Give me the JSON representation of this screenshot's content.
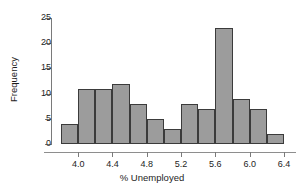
{
  "chart_data": {
    "type": "bar",
    "subtype": "histogram",
    "title": "",
    "xlabel": "% Unemployed",
    "ylabel": "Frequency",
    "xlim": [
      3.8,
      6.4
    ],
    "ylim": [
      0,
      25
    ],
    "bin_width": 0.2,
    "grid": false,
    "legend": null,
    "bar_color": "#9c9c9c",
    "bar_edge_color": "#3b3b3b",
    "x_ticks": [
      "4.0",
      "4.4",
      "4.8",
      "5.2",
      "5.6",
      "6.0",
      "6.4"
    ],
    "x_tick_values": [
      4.0,
      4.4,
      4.8,
      5.2,
      5.6,
      6.0,
      6.4
    ],
    "y_ticks": [
      "0",
      "5",
      "10",
      "15",
      "20",
      "25"
    ],
    "y_tick_values": [
      0,
      5,
      10,
      15,
      20,
      25
    ],
    "bins": [
      {
        "left": 3.8,
        "right": 4.0,
        "frequency": 4
      },
      {
        "left": 4.0,
        "right": 4.2,
        "frequency": 11
      },
      {
        "left": 4.2,
        "right": 4.4,
        "frequency": 11
      },
      {
        "left": 4.4,
        "right": 4.6,
        "frequency": 12
      },
      {
        "left": 4.6,
        "right": 4.8,
        "frequency": 8
      },
      {
        "left": 4.8,
        "right": 5.0,
        "frequency": 5
      },
      {
        "left": 5.0,
        "right": 5.2,
        "frequency": 3
      },
      {
        "left": 5.2,
        "right": 5.4,
        "frequency": 8
      },
      {
        "left": 5.4,
        "right": 5.6,
        "frequency": 7
      },
      {
        "left": 5.6,
        "right": 5.8,
        "frequency": 23
      },
      {
        "left": 5.8,
        "right": 6.0,
        "frequency": 9
      },
      {
        "left": 6.0,
        "right": 6.2,
        "frequency": 7
      },
      {
        "left": 6.2,
        "right": 6.4,
        "frequency": 2
      }
    ],
    "categories": [
      "3.8-4.0",
      "4.0-4.2",
      "4.2-4.4",
      "4.4-4.6",
      "4.6-4.8",
      "5.0-5.2",
      "5.0-5.2",
      "5.2-5.4",
      "5.4-5.6",
      "5.6-5.8",
      "5.8-6.0",
      "6.0-6.2",
      "6.2-6.4"
    ],
    "values": [
      4,
      11,
      11,
      12,
      8,
      5,
      3,
      8,
      7,
      23,
      9,
      7,
      2
    ]
  }
}
